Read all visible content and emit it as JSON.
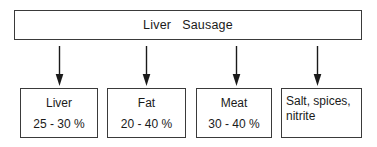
{
  "diagram": {
    "title": "Liver   Sausage",
    "arrow_count": 4,
    "arrow_icon": "arrow-down-icon",
    "components": [
      {
        "name": "Liver",
        "value": "25 - 30 %"
      },
      {
        "name": "Fat",
        "value": "20 - 40 %"
      },
      {
        "name": "Meat",
        "value": "30 - 40 %"
      },
      {
        "name": "Salt, spices,\nnitrite",
        "value": ""
      }
    ]
  }
}
